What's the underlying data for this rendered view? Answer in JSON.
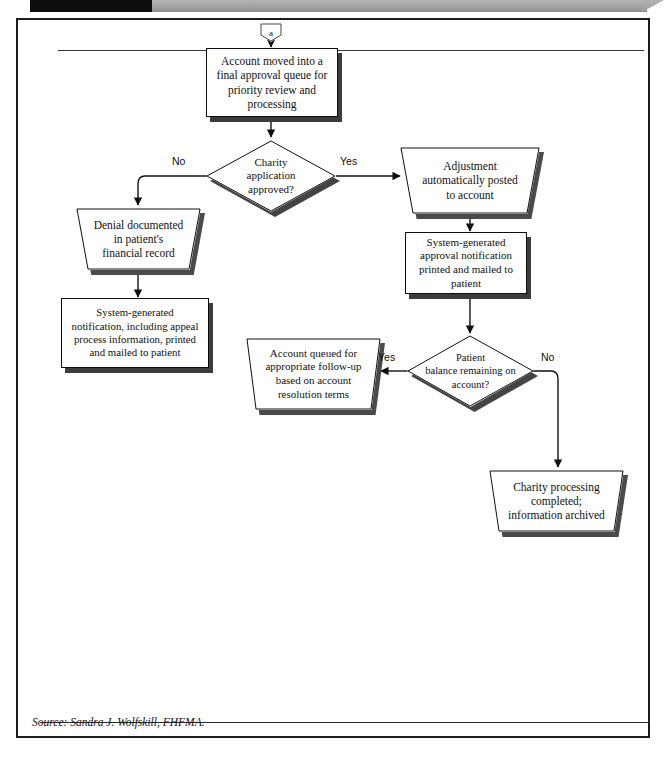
{
  "banner": {
    "black_block": "",
    "gray_block": ""
  },
  "source": {
    "text": "Source: Sandra J. Wolfskill, FHFMA."
  },
  "flow": {
    "connector_a": {
      "label": "a",
      "shape": "off-page-connector"
    },
    "nodes": [
      {
        "id": "account-moved",
        "shape": "rectangle",
        "text": "Account moved into a\nfinal approval queue for\npriority review and\nprocessing"
      },
      {
        "id": "charity-approved",
        "shape": "diamond",
        "text": "Charity\napplication\napproved?"
      },
      {
        "id": "adjustment-posted",
        "shape": "trapezoid",
        "text": "Adjustment\nautomatically posted\nto account"
      },
      {
        "id": "approval-notification",
        "shape": "rectangle",
        "text": "System-generated\napproval notification\nprinted and mailed to\npatient"
      },
      {
        "id": "denial-documented",
        "shape": "trapezoid",
        "text": "Denial documented\nin patient's\nfinancial record"
      },
      {
        "id": "denial-notification",
        "shape": "rectangle",
        "text": "System-generated\nnotification, including appeal\nprocess information, printed\nand mailed to patient"
      },
      {
        "id": "patient-balance",
        "shape": "diamond",
        "text": "Patient\nbalance remaining on\naccount?"
      },
      {
        "id": "account-queued",
        "shape": "trapezoid",
        "text": "Account queued for\nappropriate follow-up\nbased on account\nresolution terms"
      },
      {
        "id": "charity-completed",
        "shape": "trapezoid",
        "text": "Charity processing\ncompleted;\ninformation archived"
      }
    ],
    "edge_labels": {
      "charity_no": "No",
      "charity_yes": "Yes",
      "balance_yes": "Yes",
      "balance_no": "No"
    }
  },
  "colors": {
    "line": "#101010",
    "shadow": "#444444",
    "frame": "#1c1c1c",
    "banner_black": "#0d0d0d",
    "banner_gray": "#a6a6a6",
    "node_fill": "#ffffff"
  }
}
